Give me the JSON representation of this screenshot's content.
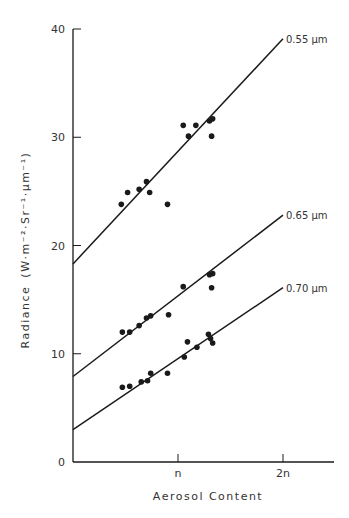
{
  "chart_data": {
    "type": "scatter",
    "title": "",
    "xlabel": "Aerosol Content",
    "ylabel": "Radiance  (W·m⁻²·Sr⁻¹·μm⁻¹)",
    "xlim": [
      0,
      2.5
    ],
    "ylim": [
      0,
      40
    ],
    "x_ticks": [
      {
        "value": 1,
        "label": "n"
      },
      {
        "value": 2,
        "label": "2n"
      }
    ],
    "y_ticks": [
      {
        "value": 0,
        "label": "0"
      },
      {
        "value": 10,
        "label": "10"
      },
      {
        "value": 20,
        "label": "20"
      },
      {
        "value": 30,
        "label": "30"
      },
      {
        "value": 40,
        "label": "40"
      }
    ],
    "grid": false,
    "legend": "inline labels at right end of fit lines",
    "series": [
      {
        "name": "0.55 μm",
        "fit_line": {
          "x": [
            0,
            2
          ],
          "y": [
            18.3,
            39.1
          ]
        },
        "points": [
          [
            0.46,
            23.8
          ],
          [
            0.52,
            24.9
          ],
          [
            0.63,
            25.2
          ],
          [
            0.7,
            25.9
          ],
          [
            0.73,
            24.9
          ],
          [
            0.9,
            23.8
          ],
          [
            1.05,
            31.1
          ],
          [
            1.1,
            30.1
          ],
          [
            1.17,
            31.1
          ],
          [
            1.3,
            31.5
          ],
          [
            1.33,
            31.7
          ],
          [
            1.32,
            30.1
          ]
        ]
      },
      {
        "name": "0.65 μm",
        "fit_line": {
          "x": [
            0,
            2
          ],
          "y": [
            7.9,
            22.8
          ]
        },
        "points": [
          [
            0.47,
            12.0
          ],
          [
            0.54,
            12.0
          ],
          [
            0.63,
            12.6
          ],
          [
            0.7,
            13.3
          ],
          [
            0.74,
            13.5
          ],
          [
            0.91,
            13.6
          ],
          [
            1.05,
            16.2
          ],
          [
            1.3,
            17.3
          ],
          [
            1.33,
            17.4
          ],
          [
            1.32,
            16.1
          ]
        ]
      },
      {
        "name": "0.70 μm",
        "fit_line": {
          "x": [
            0,
            2
          ],
          "y": [
            3.0,
            16.1
          ]
        },
        "points": [
          [
            0.47,
            6.9
          ],
          [
            0.54,
            7.0
          ],
          [
            0.65,
            7.4
          ],
          [
            0.71,
            7.5
          ],
          [
            0.74,
            8.2
          ],
          [
            0.9,
            8.2
          ],
          [
            1.06,
            9.7
          ],
          [
            1.09,
            11.1
          ],
          [
            1.18,
            10.6
          ],
          [
            1.29,
            11.8
          ],
          [
            1.31,
            11.4
          ],
          [
            1.33,
            11.0
          ]
        ]
      }
    ]
  },
  "labels": {
    "xlabel": "Aerosol Content",
    "ylabel_main": "Radiance",
    "ylabel_units": "(W·m⁻²·Sr⁻¹·μm⁻¹)",
    "series_055": "0.55 μm",
    "series_065": "0.65 μm",
    "series_070": "0.70 μm"
  },
  "colors": {
    "ink": "#1a1a1a",
    "background": "#ffffff"
  }
}
